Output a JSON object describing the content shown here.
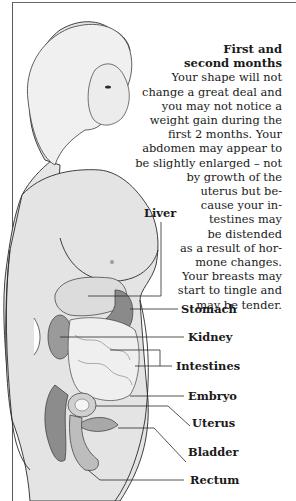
{
  "section": {
    "heading_lines": [
      "First and",
      "second months"
    ],
    "body_lines": [
      "Your shape will not",
      "change a great deal and",
      "you may not notice a",
      "weight gain during the",
      "first 2 months. Your",
      "abdomen may appear to",
      "be slightly enlarged – not",
      "by growth of the",
      "uterus but be-",
      "cause your in-",
      "testines may",
      "be distended",
      "as a result of hor-",
      "mone changes.",
      "Your breasts may",
      "start to tingle and",
      "may be tender."
    ]
  },
  "labels": {
    "liver": "Liver",
    "stomach": "Stomach",
    "kidney": "Kidney",
    "intestines": "Intestines",
    "embryo": "Embryo",
    "uterus": "Uterus",
    "bladder": "Bladder",
    "rectum": "Rectum"
  },
  "colors": {
    "skin": "#e4e4e4",
    "outline": "#2a2a2a",
    "organ_dark": "#8a8a8a",
    "organ_light": "#f2f2f2"
  }
}
